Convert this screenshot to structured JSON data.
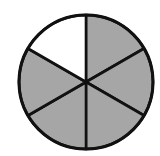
{
  "figure": {
    "description": "Circle divided into 6 equal sectors, 5 shaded",
    "total_parts": 6,
    "shaded_parts": 5,
    "unshaded_parts": 1,
    "fraction_shaded": "5/6",
    "colors": {
      "shaded": "#a6a6a6",
      "unshaded": "#ffffff",
      "stroke": "#111111"
    },
    "sectors": [
      {
        "index": 0,
        "position": "top-right",
        "shaded": true
      },
      {
        "index": 1,
        "position": "right",
        "shaded": true
      },
      {
        "index": 2,
        "position": "bottom-right",
        "shaded": true
      },
      {
        "index": 3,
        "position": "bottom-left",
        "shaded": true
      },
      {
        "index": 4,
        "position": "left",
        "shaded": true
      },
      {
        "index": 5,
        "position": "top-left",
        "shaded": false
      }
    ]
  }
}
